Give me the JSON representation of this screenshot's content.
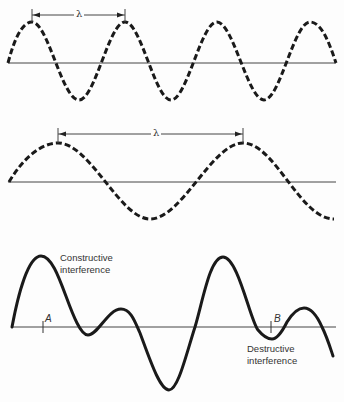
{
  "figure": {
    "panels": [
      {
        "id": "short-wavelength-wave",
        "line_style": "dashed",
        "wavelength_label": "λ"
      },
      {
        "id": "long-wavelength-wave",
        "line_style": "dashed",
        "wavelength_label": "λ"
      },
      {
        "id": "superposition-wave",
        "line_style": "solid",
        "annotations": {
          "constructive_line1": "Constructive",
          "constructive_line2": "interference",
          "destructive_line1": "Destructive",
          "destructive_line2": "interference",
          "point_a": "A",
          "point_b": "B"
        }
      }
    ],
    "colors": {
      "wave": "#1a1a1a",
      "axis": "#444444",
      "text": "#333333",
      "background": "#fdfdfd"
    }
  }
}
